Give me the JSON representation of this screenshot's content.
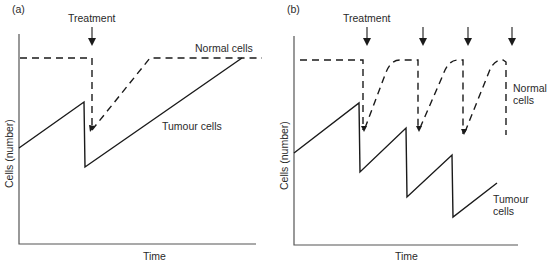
{
  "figure": {
    "panels": [
      {
        "id": "a",
        "label": "(a)",
        "treatment_label": "Treatment",
        "normal_label": "Normal cells",
        "tumour_label": "Tumour cells",
        "ylabel": "Cells (number)",
        "xlabel": "Time",
        "treatments": 1
      },
      {
        "id": "b",
        "label": "(b)",
        "treatment_label": "Treatment",
        "normal_label_line1": "Normal",
        "normal_label_line2": "cells",
        "tumour_label_line1": "Tumour",
        "tumour_label_line2": "cells",
        "ylabel": "Cells (number)",
        "xlabel": "Time",
        "treatments": 4
      }
    ],
    "colors": {
      "line": "#1a1a1a",
      "axis": "#555555",
      "background": "#ffffff"
    }
  }
}
